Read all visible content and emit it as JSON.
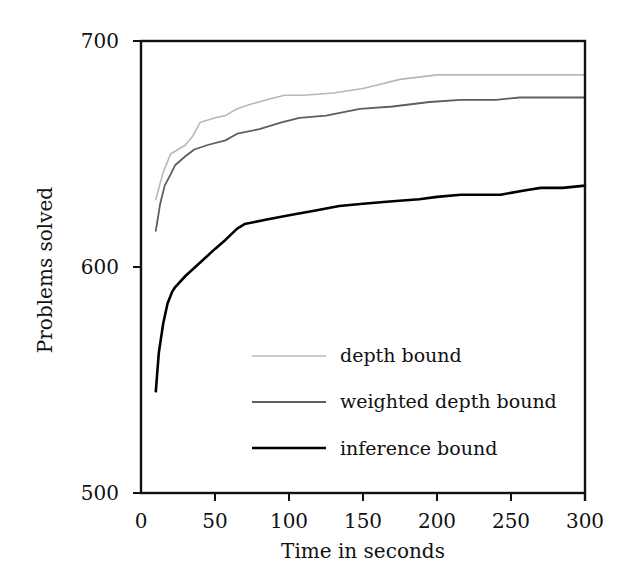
{
  "chart_data": {
    "type": "line",
    "title": "",
    "xlabel": "Time in seconds",
    "ylabel": "Problems solved",
    "xlim": [
      0,
      300
    ],
    "ylim": [
      500,
      700
    ],
    "xticks": [
      0,
      50,
      100,
      150,
      200,
      250,
      300
    ],
    "yticks": [
      500,
      600,
      700
    ],
    "grid": false,
    "legend_position": "lower right (inside plot)",
    "series": [
      {
        "name": "depth bound",
        "color": "#b8b8b8",
        "width": 1.6,
        "x": [
          10,
          15,
          20,
          25,
          30,
          35,
          40,
          50,
          57,
          65,
          74,
          85,
          97,
          110,
          130,
          150,
          175,
          200,
          216,
          240,
          270,
          300
        ],
        "values": [
          630,
          642,
          650,
          652,
          654,
          658,
          664,
          666,
          667,
          670,
          672,
          674,
          676,
          676,
          677,
          679,
          683,
          685,
          685,
          685,
          685,
          685
        ]
      },
      {
        "name": "weighted depth bound",
        "color": "#5e5e5e",
        "width": 1.8,
        "x": [
          10,
          13,
          16,
          20,
          23,
          30,
          36,
          45,
          57,
          65,
          80,
          95,
          107,
          125,
          148,
          170,
          195,
          216,
          240,
          256,
          280,
          300
        ],
        "values": [
          616,
          628,
          636,
          641,
          645,
          649,
          652,
          654,
          656,
          659,
          661,
          664,
          666,
          667,
          670,
          671,
          673,
          674,
          674,
          675,
          675,
          675
        ]
      },
      {
        "name": "inference bound",
        "color": "#000000",
        "width": 2.6,
        "x": [
          10,
          12,
          15,
          18,
          21,
          23,
          30,
          40,
          50,
          57,
          65,
          70,
          85,
          101,
          118,
          134,
          150,
          168,
          188,
          200,
          216,
          243,
          260,
          270,
          285,
          300
        ],
        "values": [
          545,
          562,
          575,
          584,
          589,
          591,
          596,
          602,
          608,
          612,
          617,
          619,
          621,
          623,
          625,
          627,
          628,
          629,
          630,
          631,
          632,
          632,
          634,
          635,
          635,
          636
        ]
      }
    ]
  },
  "axes": {
    "x_tick_labels": [
      "0",
      "50",
      "100",
      "150",
      "200",
      "250",
      "300"
    ],
    "y_tick_labels": [
      "500",
      "600",
      "700"
    ]
  },
  "legend": {
    "items": [
      {
        "label": "depth bound"
      },
      {
        "label": "weighted depth bound"
      },
      {
        "label": "inference bound"
      }
    ]
  }
}
